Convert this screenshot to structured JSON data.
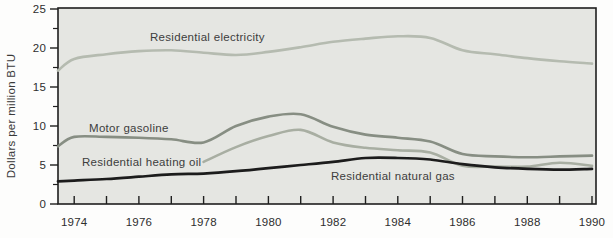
{
  "chart_data": {
    "type": "line",
    "title": "",
    "xlabel": "",
    "ylabel": "Dollars per million BTU",
    "xlim": [
      1973.5,
      1990.1
    ],
    "ylim": [
      0,
      25
    ],
    "yticks_major": [
      0,
      5,
      10,
      15,
      20,
      25
    ],
    "yticks_minor": [
      2.5,
      7.5,
      12.5,
      17.5,
      22.5
    ],
    "xticks": [
      1974,
      1975,
      1976,
      1977,
      1978,
      1979,
      1980,
      1981,
      1982,
      1983,
      1984,
      1985,
      1986,
      1987,
      1988,
      1989,
      1990
    ],
    "xtick_labels": [
      1974,
      1976,
      1978,
      1980,
      1982,
      1984,
      1986,
      1988,
      1990
    ],
    "grid": false,
    "legend": "inline-labels",
    "colors": {
      "plot_background": "#e5e6e2",
      "frame": "#1f1f1f",
      "electricity": "#b5bbb0",
      "motor_gasoline": "#878e83",
      "heating_oil": "#a8aea2",
      "natural_gas": "#1c1c1c"
    },
    "series": [
      {
        "name": "Residential electricity",
        "color_key": "electricity",
        "width": 2.6,
        "x": [
          1973.5,
          1974,
          1975,
          1976,
          1977,
          1978,
          1979,
          1980,
          1981,
          1982,
          1983,
          1984,
          1985,
          1986,
          1987,
          1988,
          1989,
          1990
        ],
        "values": [
          17.1,
          18.6,
          19.2,
          19.6,
          19.7,
          19.4,
          19.1,
          19.5,
          20.1,
          20.8,
          21.2,
          21.5,
          21.3,
          19.7,
          19.2,
          18.7,
          18.3,
          18.0
        ]
      },
      {
        "name": "Motor gasoline",
        "color_key": "motor_gasoline",
        "width": 2.6,
        "x": [
          1973.5,
          1974,
          1975,
          1976,
          1977,
          1978,
          1979,
          1980,
          1981,
          1982,
          1983,
          1984,
          1985,
          1986,
          1987,
          1988,
          1989,
          1990
        ],
        "values": [
          7.4,
          8.6,
          8.6,
          8.5,
          8.3,
          7.9,
          10.0,
          11.2,
          11.5,
          9.9,
          8.9,
          8.5,
          8.0,
          6.4,
          6.1,
          6.0,
          6.1,
          6.2
        ]
      },
      {
        "name": "Residential heating oil",
        "color_key": "heating_oil",
        "width": 2.6,
        "x": [
          1978,
          1979,
          1980,
          1981,
          1982,
          1983,
          1984,
          1985,
          1986,
          1987,
          1988,
          1989,
          1990
        ],
        "values": [
          5.4,
          7.3,
          8.7,
          9.5,
          7.9,
          7.2,
          6.9,
          6.6,
          4.9,
          4.8,
          4.8,
          5.3,
          4.9
        ]
      },
      {
        "name": "Residential natural gas",
        "color_key": "natural_gas",
        "width": 2.7,
        "x": [
          1973.5,
          1974,
          1975,
          1976,
          1977,
          1978,
          1979,
          1980,
          1981,
          1982,
          1983,
          1984,
          1985,
          1986,
          1987,
          1988,
          1989,
          1990
        ],
        "values": [
          2.9,
          3.0,
          3.2,
          3.5,
          3.8,
          3.9,
          4.2,
          4.6,
          5.0,
          5.4,
          5.9,
          5.9,
          5.7,
          5.1,
          4.7,
          4.5,
          4.4,
          4.5
        ]
      }
    ],
    "annotations": [
      {
        "text": "Residential electricity",
        "x": 150,
        "y": 41
      },
      {
        "text": "Motor gasoline",
        "x": 89,
        "y": 132
      },
      {
        "text": "Residential heating oil",
        "x": 82,
        "y": 166
      },
      {
        "text": "Residential natural gas",
        "x": 331,
        "y": 180
      }
    ]
  }
}
